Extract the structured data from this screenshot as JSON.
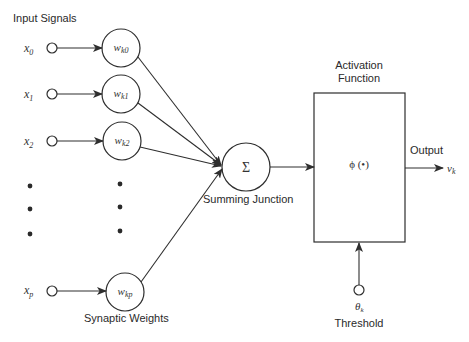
{
  "labels": {
    "input_signals": "Input Signals",
    "synaptic_weights": "Synaptic Weights",
    "summing_junction": "Summing Junction",
    "activation_function_line1": "Activation",
    "activation_function_line2": "Function",
    "output": "Output",
    "threshold": "Threshold"
  },
  "inputs": [
    {
      "symbol": "x",
      "sub": "0"
    },
    {
      "symbol": "x",
      "sub": "1"
    },
    {
      "symbol": "x",
      "sub": "2"
    },
    {
      "symbol": "x",
      "sub": "p"
    }
  ],
  "weights": [
    {
      "symbol": "w",
      "sub": "k0"
    },
    {
      "symbol": "w",
      "sub": "k1"
    },
    {
      "symbol": "w",
      "sub": "k2"
    },
    {
      "symbol": "w",
      "sub": "kp"
    }
  ],
  "summing_symbol": "Σ",
  "activation_symbol": "ϕ (•)",
  "output_symbol": {
    "symbol": "v",
    "sub": "k"
  },
  "threshold_symbol": {
    "symbol": "θ",
    "sub": "k"
  },
  "colors": {
    "line": "#2e2e2e",
    "text": "#2a2a2a",
    "background": "#ffffff"
  }
}
